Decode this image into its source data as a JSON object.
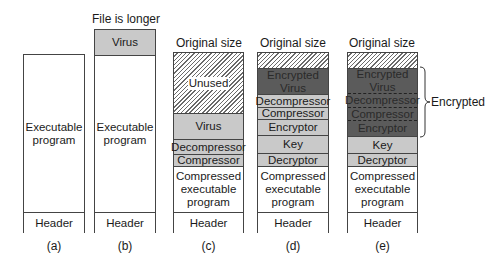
{
  "figure": {
    "panels": [
      {
        "id": "a",
        "caption": "(a)",
        "top_label": "",
        "segments": [
          {
            "label": "Executable\nprogram",
            "fill": "white"
          },
          {
            "label": "Header",
            "fill": "white"
          }
        ]
      },
      {
        "id": "b",
        "caption": "(b)",
        "top_label": "File is longer",
        "segments": [
          {
            "label": "Virus",
            "fill": "light"
          },
          {
            "label": "Executable\nprogram",
            "fill": "white"
          },
          {
            "label": "Header",
            "fill": "white"
          }
        ]
      },
      {
        "id": "c",
        "caption": "(c)",
        "top_label": "Original size",
        "segments": [
          {
            "label": "Unused",
            "fill": "hatched"
          },
          {
            "label": "Virus",
            "fill": "light"
          },
          {
            "label": "Decompressor",
            "fill": "light"
          },
          {
            "label": "Compressor",
            "fill": "light"
          },
          {
            "label": "Compressed\nexecutable\nprogram",
            "fill": "white"
          },
          {
            "label": "Header",
            "fill": "white"
          }
        ]
      },
      {
        "id": "d",
        "caption": "(d)",
        "top_label": "Original size",
        "segments": [
          {
            "label": "",
            "fill": "hatched"
          },
          {
            "label": "Encrypted\nVirus",
            "fill": "dark"
          },
          {
            "label": "Decompressor",
            "fill": "light"
          },
          {
            "label": "Compressor",
            "fill": "light"
          },
          {
            "label": "Encryptor",
            "fill": "light"
          },
          {
            "label": "Key",
            "fill": "light"
          },
          {
            "label": "Decryptor",
            "fill": "light"
          },
          {
            "label": "Compressed\nexecutable\nprogram",
            "fill": "white"
          },
          {
            "label": "Header",
            "fill": "white"
          }
        ]
      },
      {
        "id": "e",
        "caption": "(e)",
        "top_label": "Original size",
        "segments": [
          {
            "label": "",
            "fill": "hatched"
          },
          {
            "label": "Encrypted\nVirus",
            "fill": "dark"
          },
          {
            "label": "Decompressor",
            "fill": "dark"
          },
          {
            "label": "Compressor",
            "fill": "dark"
          },
          {
            "label": "Encryptor",
            "fill": "dark"
          },
          {
            "label": "Key",
            "fill": "light"
          },
          {
            "label": "Decryptor",
            "fill": "light"
          },
          {
            "label": "Compressed\nexecutable\nprogram",
            "fill": "white"
          },
          {
            "label": "Header",
            "fill": "white"
          }
        ],
        "brace_label": "Encrypted"
      }
    ],
    "colors": {
      "white": "#ffffff",
      "light": "#c9c9c9",
      "dark": "#5b5b5b",
      "outline": "#444444"
    }
  }
}
